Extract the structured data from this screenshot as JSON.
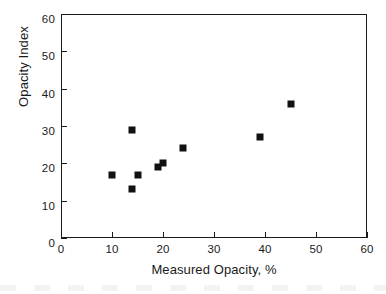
{
  "chart_data": {
    "type": "scatter",
    "title": "",
    "xlabel": "Measured Opacity, %",
    "ylabel": "Opacity Index",
    "xlim": [
      0,
      60
    ],
    "ylim": [
      0,
      60
    ],
    "xticks": [
      0,
      10,
      20,
      30,
      40,
      50,
      60
    ],
    "yticks": [
      0,
      10,
      20,
      30,
      40,
      50,
      60
    ],
    "xtick_labels": [
      "0",
      "10",
      "20",
      "30",
      "40",
      "50",
      "60"
    ],
    "ytick_labels": [
      "0",
      "10",
      "20",
      "30",
      "40",
      "50",
      "60"
    ],
    "grid": false,
    "legend": null,
    "marker": "filled-square",
    "marker_color": "#111111",
    "series": [
      {
        "name": "Opacity Index vs Measured Opacity",
        "points": [
          {
            "x": 10,
            "y": 17
          },
          {
            "x": 14,
            "y": 29
          },
          {
            "x": 14,
            "y": 13
          },
          {
            "x": 15,
            "y": 17
          },
          {
            "x": 19,
            "y": 19
          },
          {
            "x": 20,
            "y": 20
          },
          {
            "x": 24,
            "y": 24
          },
          {
            "x": 39,
            "y": 27
          },
          {
            "x": 45,
            "y": 36
          }
        ]
      }
    ]
  },
  "figure": {
    "background_color": "#ffffff",
    "axis_color": "#1a1a1a"
  }
}
